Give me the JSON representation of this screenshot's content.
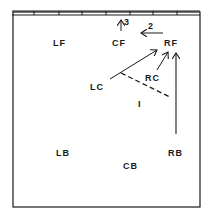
{
  "diagram": {
    "type": "volleyball-court-rotation",
    "positions": {
      "LF": "LF",
      "CF": "CF",
      "RF": "RF",
      "LC": "LC",
      "RC": "RC",
      "LB": "LB",
      "CB": "CB",
      "RB": "RB"
    },
    "arrows": {
      "arrow_3": "3",
      "arrow_2": "2",
      "marker_1": "I"
    },
    "colors": {
      "ink": "#1a1a1a",
      "background": "#ffffff"
    }
  }
}
